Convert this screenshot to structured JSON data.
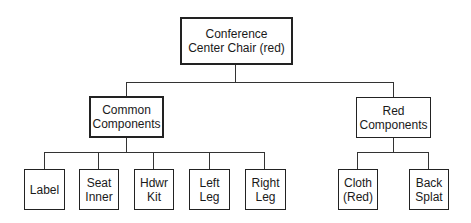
{
  "diagram": {
    "type": "hierarchy-tree",
    "root": {
      "label_line1": "Conference",
      "label_line2": "Center Chair (red)"
    },
    "groups": [
      {
        "label_line1": "Common",
        "label_line2": "Components",
        "children": [
          {
            "label_line1": "Label",
            "label_line2": ""
          },
          {
            "label_line1": "Seat",
            "label_line2": "Inner"
          },
          {
            "label_line1": "Hdwr",
            "label_line2": "Kit"
          },
          {
            "label_line1": "Left",
            "label_line2": "Leg"
          },
          {
            "label_line1": "Right",
            "label_line2": "Leg"
          }
        ]
      },
      {
        "label_line1": "Red",
        "label_line2": "Components",
        "children": [
          {
            "label_line1": "Cloth",
            "label_line2": "(Red)"
          },
          {
            "label_line1": "Back",
            "label_line2": "Splat"
          }
        ]
      }
    ]
  }
}
